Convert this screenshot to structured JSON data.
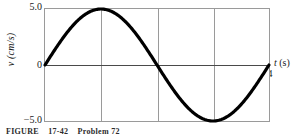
{
  "axes": {
    "ylabel": "v (cm/s)",
    "xlabel_var": "t",
    "xlabel_unit": "(s)",
    "ytick_top": "5.0",
    "ytick_zero": "0",
    "ytick_bottom": "−5.0",
    "xticks": [
      "1",
      "2",
      "3",
      "4"
    ],
    "frame_color": "#9a9a9a",
    "axis_color": "#4a4a4a",
    "curve_color": "#000000"
  },
  "caption": {
    "label": "FIGURE",
    "number": "17-42",
    "problem": "Problem 72"
  },
  "chart_data": {
    "type": "line",
    "title": "",
    "xlabel": "t (s)",
    "ylabel": "v (cm/s)",
    "xlim": [
      0,
      4
    ],
    "ylim": [
      -5.0,
      5.0
    ],
    "xticks": [
      0,
      1,
      2,
      3,
      4
    ],
    "yticks": [
      -5.0,
      0,
      5.0
    ],
    "grid": "vertical-only",
    "legend": "none",
    "series": [
      {
        "name": "velocity",
        "equation": "v = 5.0 sin(pi t / 2)",
        "x": [
          0,
          0.125,
          0.25,
          0.375,
          0.5,
          0.625,
          0.75,
          0.875,
          1,
          1.125,
          1.25,
          1.375,
          1.5,
          1.625,
          1.75,
          1.875,
          2,
          2.125,
          2.25,
          2.375,
          2.5,
          2.625,
          2.75,
          2.875,
          3,
          3.125,
          3.25,
          3.375,
          3.5,
          3.625,
          3.75,
          3.875,
          4
        ],
        "y": [
          0,
          0.975,
          1.913,
          2.778,
          3.536,
          4.157,
          4.619,
          4.904,
          5.0,
          4.904,
          4.619,
          4.157,
          3.536,
          2.778,
          1.913,
          0.975,
          0,
          -0.975,
          -1.913,
          -2.778,
          -3.536,
          -4.157,
          -4.619,
          -4.904,
          -5.0,
          -4.904,
          -4.619,
          -4.157,
          -3.536,
          -2.778,
          -1.913,
          -0.975,
          0
        ]
      }
    ],
    "annotations": {
      "maximum": {
        "x": 1,
        "y": 5.0
      },
      "minimum": {
        "x": 3,
        "y": -5.0
      },
      "zero_crossings": [
        0,
        2,
        4
      ]
    }
  }
}
